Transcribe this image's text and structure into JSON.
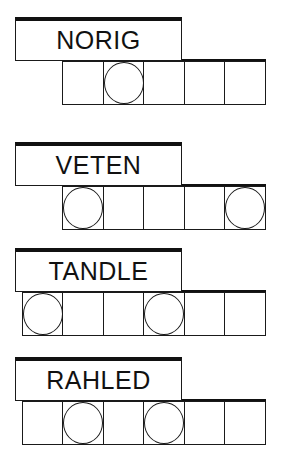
{
  "puzzles": [
    {
      "word": "NORIG",
      "cell_count": 5,
      "circled": [
        1
      ]
    },
    {
      "word": "VETEN",
      "cell_count": 5,
      "circled": [
        0,
        4
      ]
    },
    {
      "word": "TANDLE",
      "cell_count": 6,
      "circled": [
        0,
        3
      ]
    },
    {
      "word": "RAHLED",
      "cell_count": 6,
      "circled": [
        1,
        3
      ]
    }
  ],
  "colors": {
    "line": "#1a1a1a",
    "background": "#ffffff"
  }
}
